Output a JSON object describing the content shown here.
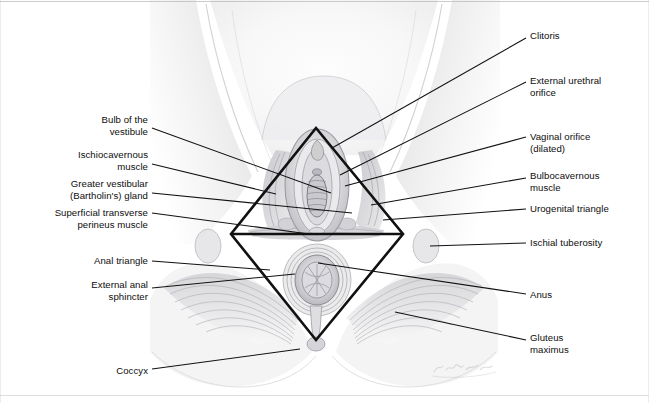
{
  "figure": {
    "artist_signature": "K. Sommer",
    "background_color": "#ffffff",
    "leader_line_color": "#111111",
    "diamond_outline_color": "#111111",
    "border_color": "#b9b9bd",
    "width": 649,
    "height": 403
  },
  "diamond": {
    "name": "perineum-diamond",
    "description": "Bold black rhombus dividing the perineum into an upper urogenital triangle and a lower anal triangle",
    "vertices": {
      "top": [
        316,
        128
      ],
      "right": [
        403,
        234
      ],
      "bottom": [
        316,
        340
      ],
      "left": [
        231,
        234
      ]
    },
    "midline": [
      [
        231,
        234
      ],
      [
        403,
        234
      ]
    ]
  },
  "labels_left": [
    {
      "id": "bulb-of-the-vestibule",
      "text": "Bulb of the\nvestibule",
      "anchor_x": 148,
      "anchor_y": 126,
      "leader_from": [
        152,
        128
      ],
      "leader_to": [
        331,
        193
      ]
    },
    {
      "id": "ischiocavernous-muscle",
      "text": "Ischiocavernous\nmuscle",
      "anchor_x": 148,
      "anchor_y": 161,
      "leader_from": [
        152,
        164
      ],
      "leader_to": [
        276,
        194
      ]
    },
    {
      "id": "greater-vestibular-bartholins-gland",
      "text": "Greater vestibular\n(Bartholin's) gland",
      "anchor_x": 148,
      "anchor_y": 190,
      "leader_from": [
        152,
        193
      ],
      "leader_to": [
        352,
        213
      ]
    },
    {
      "id": "superficial-transverse-perineus-muscle",
      "text": "Superficial transverse\nperineus muscle",
      "anchor_x": 148,
      "anchor_y": 219,
      "leader_from": [
        152,
        213
      ],
      "leader_to": [
        309,
        234
      ]
    },
    {
      "id": "anal-triangle",
      "text": "Anal triangle",
      "anchor_x": 148,
      "anchor_y": 261,
      "leader_from": [
        152,
        261
      ],
      "leader_to": [
        270,
        270
      ]
    },
    {
      "id": "external-anal-sphincter",
      "text": "External anal\nsphincter",
      "anchor_x": 148,
      "anchor_y": 291,
      "leader_from": [
        152,
        288
      ],
      "leader_to": [
        295,
        274
      ]
    },
    {
      "id": "coccyx",
      "text": "Coccyx",
      "anchor_x": 148,
      "anchor_y": 371,
      "leader_from": [
        152,
        369
      ],
      "leader_to": [
        300,
        349
      ]
    }
  ],
  "labels_right": [
    {
      "id": "clitoris",
      "text": "Clitoris",
      "anchor_x": 530,
      "anchor_y": 36,
      "leader_from": [
        526,
        38
      ],
      "leader_to": [
        332,
        148
      ]
    },
    {
      "id": "external-urethral-orifice",
      "text": "External urethral\norifice",
      "anchor_x": 530,
      "anchor_y": 87,
      "leader_from": [
        526,
        82
      ],
      "leader_to": [
        340,
        175
      ]
    },
    {
      "id": "vaginal-orifice-dilated",
      "text": "Vaginal orifice\n(dilated)",
      "anchor_x": 530,
      "anchor_y": 143,
      "leader_from": [
        526,
        137
      ],
      "leader_to": [
        345,
        186
      ]
    },
    {
      "id": "bulbocavernous-muscle",
      "text": "Bulbocavernous\nmuscle",
      "anchor_x": 530,
      "anchor_y": 182,
      "leader_from": [
        526,
        178
      ],
      "leader_to": [
        371,
        205
      ]
    },
    {
      "id": "urogenital-triangle",
      "text": "Urogenital triangle",
      "anchor_x": 530,
      "anchor_y": 209,
      "leader_from": [
        526,
        209
      ],
      "leader_to": [
        383,
        220
      ]
    },
    {
      "id": "ischial-tuberosity",
      "text": "Ischial tuberosity",
      "anchor_x": 530,
      "anchor_y": 243,
      "leader_from": [
        526,
        243
      ],
      "leader_to": [
        430,
        246
      ]
    },
    {
      "id": "anus",
      "text": "Anus",
      "anchor_x": 530,
      "anchor_y": 295,
      "leader_from": [
        526,
        294
      ],
      "leader_to": [
        318,
        263
      ]
    },
    {
      "id": "gluteus-maximus",
      "text": "Gluteus\nmaximus",
      "anchor_x": 530,
      "anchor_y": 344,
      "leader_from": [
        526,
        340
      ],
      "leader_to": [
        395,
        312
      ]
    }
  ]
}
